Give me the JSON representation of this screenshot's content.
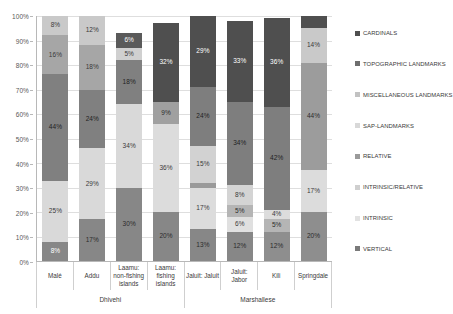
{
  "chart_data": {
    "type": "bar",
    "subtype": "stacked-percentage",
    "title": "",
    "xlabel": "",
    "ylabel": "",
    "ylim": [
      0,
      100
    ],
    "grid": true,
    "legend_position": "right",
    "y_ticks": [
      "0%",
      "10%",
      "20%",
      "30%",
      "40%",
      "50%",
      "60%",
      "70%",
      "80%",
      "90%",
      "100%"
    ],
    "categories": [
      "Malé",
      "Addu",
      "Laamu: non-fishing islands",
      "Laamu: fishing islands",
      "Jaluit: Jaluit",
      "Jaluit: Jabor",
      "Kili",
      "Springdale"
    ],
    "groups": [
      {
        "label": "Dhivehi",
        "span": 4
      },
      {
        "label": "Marshallese",
        "span": 4
      }
    ],
    "series": [
      {
        "name": "VERTICAL",
        "color": "#878787",
        "values": [
          8,
          17,
          30,
          20,
          13,
          12,
          12,
          20
        ]
      },
      {
        "name": "INTRINSIC",
        "color": "#d9d9d9",
        "values": [
          25,
          29,
          34,
          36,
          17,
          6,
          4,
          17
        ]
      },
      {
        "name": "INTRINSIC/RELATIVE",
        "color": "#bfbfbf",
        "values": [
          0,
          0,
          0,
          0,
          2,
          5,
          5,
          0
        ]
      },
      {
        "name": "RELATIVE",
        "color": "#808080",
        "values": [
          44,
          24,
          18,
          9,
          15,
          8,
          0,
          0
        ]
      },
      {
        "name": "SAP-LANDMARKS",
        "color": "#e8e8e8",
        "values": [
          0,
          0,
          0,
          0,
          0,
          2,
          0,
          0
        ]
      },
      {
        "name": "MISCELLANEOUS LANDMARKS",
        "color": "#a6a6a6",
        "values": [
          16,
          18,
          5,
          0,
          24,
          34,
          42,
          44
        ]
      },
      {
        "name": "TOPOGRAPHIC LANDMARKS",
        "color": "#c9c9c9",
        "values": [
          8,
          12,
          0,
          0,
          0,
          0,
          0,
          14
        ]
      },
      {
        "name": "CARDINALS",
        "color": "#5a5a5a",
        "values": [
          0,
          0,
          6,
          32,
          29,
          33,
          36,
          5
        ]
      }
    ],
    "bar_stacks": [
      {
        "category": "Malé",
        "segments": [
          {
            "series": "VERTICAL",
            "value": 8,
            "label": "8%",
            "color": "#878787",
            "label_color": "#ffffff"
          },
          {
            "series": "INTRINSIC",
            "value": 25,
            "label": "25%",
            "color": "#d9d9d9",
            "label_color": "#3a3a3a"
          },
          {
            "series": "RELATIVE",
            "value": 44,
            "label": "44%",
            "color": "#808080",
            "label_color": "#1f1f1f"
          },
          {
            "series": "MISCELLANEOUS LANDMARKS",
            "value": 16,
            "label": "16%",
            "color": "#a6a6a6",
            "label_color": "#3a3a3a"
          },
          {
            "series": "TOPOGRAPHIC LANDMARKS",
            "value": 8,
            "label": "8%",
            "color": "#c9c9c9",
            "label_color": "#3a3a3a"
          }
        ]
      },
      {
        "category": "Addu",
        "segments": [
          {
            "series": "VERTICAL",
            "value": 17,
            "label": "17%",
            "color": "#878787",
            "label_color": "#2b2b2b"
          },
          {
            "series": "INTRINSIC",
            "value": 29,
            "label": "29%",
            "color": "#d9d9d9",
            "label_color": "#3a3a3a"
          },
          {
            "series": "RELATIVE",
            "value": 24,
            "label": "24%",
            "color": "#808080",
            "label_color": "#1f1f1f"
          },
          {
            "series": "MISCELLANEOUS LANDMARKS",
            "value": 18,
            "label": "18%",
            "color": "#a6a6a6",
            "label_color": "#3a3a3a"
          },
          {
            "series": "TOPOGRAPHIC LANDMARKS",
            "value": 12,
            "label": "12%",
            "color": "#c9c9c9",
            "label_color": "#3a3a3a"
          }
        ]
      },
      {
        "category": "Laamu: non-fishing islands",
        "segments": [
          {
            "series": "VERTICAL",
            "value": 30,
            "label": "30%",
            "color": "#878787",
            "label_color": "#2b2b2b"
          },
          {
            "series": "INTRINSIC",
            "value": 34,
            "label": "34%",
            "color": "#d9d9d9",
            "label_color": "#3a3a3a"
          },
          {
            "series": "RELATIVE",
            "value": 18,
            "label": "18%",
            "color": "#808080",
            "label_color": "#1f1f1f"
          },
          {
            "series": "MISCELLANEOUS LANDMARKS",
            "value": 5,
            "label": "5%",
            "color": "#d0d0d0",
            "label_color": "#3a3a3a"
          },
          {
            "series": "CARDINALS",
            "value": 6,
            "label": "6%",
            "color": "#5a5a5a",
            "label_color": "#ffffff"
          }
        ]
      },
      {
        "category": "Laamu: fishing islands",
        "segments": [
          {
            "series": "VERTICAL",
            "value": 20,
            "label": "20%",
            "color": "#878787",
            "label_color": "#2b2b2b"
          },
          {
            "series": "INTRINSIC",
            "value": 36,
            "label": "36%",
            "color": "#dcdcdc",
            "label_color": "#3a3a3a"
          },
          {
            "series": "RELATIVE",
            "value": 9,
            "label": "9%",
            "color": "#a0a0a0",
            "label_color": "#2b2b2b"
          },
          {
            "series": "CARDINALS",
            "value": 32,
            "label": "32%",
            "color": "#4f4f4f",
            "label_color": "#ffffff"
          }
        ]
      },
      {
        "category": "Jaluit: Jaluit",
        "segments": [
          {
            "series": "VERTICAL",
            "value": 13,
            "label": "13%",
            "color": "#878787",
            "label_color": "#2b2b2b"
          },
          {
            "series": "INTRINSIC",
            "value": 17,
            "label": "17%",
            "color": "#dcdcdc",
            "label_color": "#3a3a3a"
          },
          {
            "series": "INTRINSIC/RELATIVE",
            "value": 2,
            "label": "",
            "color": "#9a9a9a",
            "label_color": "#2b2b2b"
          },
          {
            "series": "RELATIVE",
            "value": 15,
            "label": "15%",
            "color": "#d2d2d2",
            "label_color": "#3a3a3a"
          },
          {
            "series": "MISCELLANEOUS LANDMARKS",
            "value": 24,
            "label": "24%",
            "color": "#7e7e7e",
            "label_color": "#1f1f1f"
          },
          {
            "series": "CARDINALS",
            "value": 29,
            "label": "29%",
            "color": "#4f4f4f",
            "label_color": "#ffffff"
          }
        ]
      },
      {
        "category": "Jaluit: Jabor",
        "segments": [
          {
            "series": "VERTICAL",
            "value": 12,
            "label": "12%",
            "color": "#878787",
            "label_color": "#2b2b2b"
          },
          {
            "series": "INTRINSIC",
            "value": 6,
            "label": "6%",
            "color": "#e0e0e0",
            "label_color": "#3a3a3a"
          },
          {
            "series": "INTRINSIC/RELATIVE",
            "value": 5,
            "label": "5%",
            "color": "#b5b5b5",
            "label_color": "#2b2b2b"
          },
          {
            "series": "SAP-LANDMARKS",
            "value": 8,
            "label": "8%",
            "color": "#d4d4d4",
            "label_color": "#3a3a3a"
          },
          {
            "series": "MISCELLANEOUS LANDMARKS",
            "value": 34,
            "label": "34%",
            "color": "#7e7e7e",
            "label_color": "#1f1f1f"
          },
          {
            "series": "CARDINALS",
            "value": 33,
            "label": "33%",
            "color": "#4f4f4f",
            "label_color": "#ffffff"
          }
        ]
      },
      {
        "category": "Kili",
        "segments": [
          {
            "series": "VERTICAL",
            "value": 12,
            "label": "12%",
            "color": "#8e8e8e",
            "label_color": "#2b2b2b"
          },
          {
            "series": "INTRINSIC",
            "value": 5,
            "label": "5%",
            "color": "#b5b5b5",
            "label_color": "#2b2b2b"
          },
          {
            "series": "INTRINSIC/RELATIVE",
            "value": 4,
            "label": "4%",
            "color": "#dcdcdc",
            "label_color": "#3a3a3a"
          },
          {
            "series": "MISCELLANEOUS LANDMARKS",
            "value": 42,
            "label": "42%",
            "color": "#7e7e7e",
            "label_color": "#1f1f1f"
          },
          {
            "series": "CARDINALS",
            "value": 36,
            "label": "36%",
            "color": "#4f4f4f",
            "label_color": "#ffffff"
          }
        ]
      },
      {
        "category": "Springdale",
        "segments": [
          {
            "series": "VERTICAL",
            "value": 20,
            "label": "20%",
            "color": "#8e8e8e",
            "label_color": "#2b2b2b"
          },
          {
            "series": "INTRINSIC",
            "value": 17,
            "label": "17%",
            "color": "#dcdcdc",
            "label_color": "#3a3a3a"
          },
          {
            "series": "MISCELLANEOUS LANDMARKS",
            "value": 44,
            "label": "44%",
            "color": "#9c9c9c",
            "label_color": "#2b2b2b"
          },
          {
            "series": "TOPOGRAPHIC LANDMARKS",
            "value": 14,
            "label": "14%",
            "color": "#c9c9c9",
            "label_color": "#3a3a3a"
          },
          {
            "series": "CARDINALS",
            "value": 5,
            "label": "",
            "color": "#4f4f4f",
            "label_color": "#ffffff"
          }
        ]
      }
    ],
    "legend": [
      {
        "label": "CARDINALS",
        "color": "#4f4f4f"
      },
      {
        "label": "TOPOGRAPHIC LANDMARKS",
        "color": "#6e6e6e"
      },
      {
        "label": "MISCELLANEOUS LANDMARKS",
        "color": "#c2c2c2"
      },
      {
        "label": "SAP-LANDMARKS",
        "color": "#d8d8d8"
      },
      {
        "label": "RELATIVE",
        "color": "#9a9a9a"
      },
      {
        "label": "INTRINSIC/RELATIVE",
        "color": "#cfcfcf"
      },
      {
        "label": "INTRINSIC",
        "color": "#e2e2e2"
      },
      {
        "label": "VERTICAL",
        "color": "#7a7a7a"
      }
    ]
  }
}
